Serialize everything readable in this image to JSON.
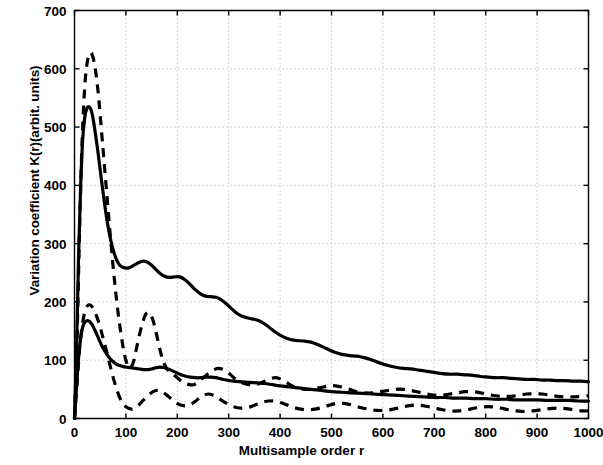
{
  "chart_data": {
    "type": "line",
    "title": "",
    "xlabel": "Multisample order r",
    "ylabel": "Variation coefficient K(r)(arbit. units)",
    "xlim": [
      0,
      1000
    ],
    "ylim": [
      0,
      700
    ],
    "xticks": [
      0,
      100,
      200,
      300,
      400,
      500,
      600,
      700,
      800,
      900,
      1000
    ],
    "yticks": [
      0,
      100,
      200,
      300,
      400,
      500,
      600,
      700
    ],
    "grid": true,
    "legend": "none",
    "series": [
      {
        "name": "upper-solid",
        "style": "solid",
        "color": "#000000",
        "x": [
          0,
          4,
          8,
          12,
          16,
          20,
          24,
          28,
          32,
          36,
          40,
          46,
          52,
          58,
          64,
          70,
          76,
          82,
          88,
          95,
          102,
          110,
          118,
          126,
          134,
          142,
          150,
          158,
          166,
          175,
          185,
          195,
          205,
          215,
          225,
          235,
          245,
          255,
          265,
          275,
          285,
          295,
          305,
          315,
          325,
          335,
          345,
          355,
          365,
          375,
          385,
          400,
          415,
          430,
          445,
          460,
          475,
          490,
          505,
          520,
          535,
          550,
          565,
          580,
          595,
          610,
          625,
          640,
          655,
          670,
          685,
          700,
          715,
          730,
          745,
          760,
          775,
          790,
          805,
          820,
          835,
          850,
          865,
          880,
          895,
          910,
          925,
          940,
          955,
          970,
          985,
          1000
        ],
        "y": [
          0,
          120,
          280,
          400,
          480,
          517,
          532,
          535,
          530,
          515,
          493,
          455,
          412,
          372,
          336,
          308,
          287,
          272,
          263,
          259,
          258,
          260,
          264,
          268,
          270,
          268,
          263,
          256,
          249,
          244,
          242,
          243,
          243,
          238,
          230,
          221,
          214,
          210,
          209,
          208,
          204,
          197,
          189,
          181,
          176,
          173,
          171,
          169,
          165,
          159,
          152,
          143,
          137,
          134,
          133,
          131,
          126,
          120,
          114,
          110,
          108,
          107,
          104,
          100,
          95,
          91,
          88,
          86,
          85,
          83,
          81,
          79,
          77,
          76,
          76,
          75,
          74,
          72,
          71,
          70,
          70,
          69,
          68,
          67,
          67,
          66,
          66,
          65,
          65,
          64,
          64,
          63
        ]
      },
      {
        "name": "upper-dashed",
        "style": "dashed",
        "color": "#000000",
        "x": [
          0,
          5,
          10,
          15,
          20,
          25,
          30,
          34,
          38,
          42,
          46,
          50,
          55,
          60,
          65,
          70,
          75,
          80,
          85,
          90,
          95,
          100,
          105,
          110,
          115,
          120,
          126,
          132,
          138,
          144,
          150,
          156,
          162,
          168,
          174,
          180,
          186,
          192,
          200,
          208,
          216,
          224,
          232,
          240,
          248,
          256,
          264,
          272,
          280,
          290,
          300,
          310,
          320,
          330,
          340,
          350,
          360,
          370,
          380,
          390,
          400,
          412,
          424,
          436,
          448,
          460,
          472,
          484,
          496,
          508,
          520,
          535,
          550,
          565,
          580,
          595,
          610,
          625,
          640,
          655,
          670,
          685,
          700,
          715,
          730,
          745,
          760,
          775,
          790,
          805,
          820,
          835,
          850,
          865,
          880,
          895,
          910,
          925,
          940,
          955,
          970,
          985,
          1000
        ],
        "y": [
          0,
          140,
          330,
          480,
          570,
          612,
          627,
          625,
          612,
          590,
          560,
          520,
          468,
          415,
          362,
          310,
          262,
          218,
          180,
          148,
          120,
          100,
          88,
          88,
          98,
          118,
          142,
          163,
          178,
          182,
          175,
          158,
          135,
          112,
          95,
          85,
          80,
          76,
          70,
          64,
          60,
          58,
          58,
          62,
          68,
          74,
          80,
          84,
          86,
          84,
          78,
          70,
          64,
          60,
          58,
          58,
          60,
          64,
          68,
          70,
          68,
          62,
          56,
          52,
          50,
          50,
          52,
          54,
          56,
          56,
          54,
          50,
          46,
          44,
          44,
          46,
          48,
          50,
          50,
          48,
          45,
          42,
          40,
          40,
          42,
          44,
          46,
          46,
          44,
          41,
          39,
          38,
          38,
          40,
          42,
          43,
          42,
          40,
          38,
          37,
          37,
          38,
          39
        ]
      },
      {
        "name": "lower-solid",
        "style": "solid",
        "color": "#000000",
        "x": [
          0,
          4,
          8,
          12,
          16,
          20,
          25,
          30,
          35,
          40,
          46,
          52,
          58,
          64,
          70,
          76,
          82,
          88,
          95,
          102,
          110,
          118,
          126,
          134,
          142,
          150,
          158,
          166,
          175,
          185,
          195,
          205,
          215,
          225,
          235,
          245,
          255,
          265,
          275,
          285,
          295,
          310,
          325,
          340,
          355,
          370,
          385,
          400,
          420,
          440,
          460,
          480,
          500,
          520,
          540,
          560,
          580,
          600,
          620,
          640,
          660,
          680,
          700,
          720,
          740,
          760,
          780,
          800,
          820,
          840,
          860,
          880,
          900,
          920,
          940,
          960,
          980,
          1000
        ],
        "y": [
          0,
          55,
          105,
          138,
          157,
          165,
          168,
          166,
          160,
          151,
          139,
          127,
          117,
          109,
          102,
          97,
          93,
          91,
          89,
          88,
          87,
          86,
          85,
          84,
          84,
          85,
          87,
          88,
          87,
          84,
          80,
          76,
          73,
          71,
          70,
          70,
          71,
          71,
          70,
          68,
          66,
          64,
          63,
          62,
          61,
          60,
          58,
          56,
          54,
          52,
          50,
          48,
          46,
          45,
          44,
          43,
          42,
          41,
          40,
          39,
          38,
          37,
          36,
          36,
          35,
          35,
          34,
          34,
          33,
          33,
          32,
          32,
          32,
          31,
          31,
          31,
          30,
          30
        ]
      },
      {
        "name": "lower-dashed",
        "style": "dashed",
        "color": "#000000",
        "x": [
          0,
          5,
          10,
          16,
          22,
          28,
          34,
          40,
          46,
          52,
          58,
          64,
          70,
          76,
          82,
          88,
          94,
          100,
          106,
          112,
          118,
          124,
          130,
          137,
          144,
          151,
          158,
          165,
          172,
          180,
          188,
          196,
          204,
          212,
          220,
          228,
          236,
          244,
          252,
          260,
          270,
          280,
          290,
          300,
          310,
          320,
          330,
          342,
          354,
          366,
          378,
          390,
          402,
          414,
          426,
          440,
          454,
          468,
          482,
          496,
          510,
          524,
          540,
          556,
          572,
          588,
          604,
          620,
          636,
          652,
          668,
          684,
          700,
          716,
          732,
          748,
          764,
          780,
          796,
          812,
          828,
          844,
          860,
          876,
          892,
          908,
          924,
          940,
          956,
          972,
          988,
          1000
        ],
        "y": [
          0,
          60,
          120,
          165,
          188,
          195,
          192,
          182,
          168,
          150,
          130,
          110,
          88,
          68,
          50,
          36,
          26,
          20,
          17,
          16,
          18,
          22,
          28,
          34,
          40,
          45,
          48,
          48,
          45,
          40,
          34,
          28,
          24,
          22,
          22,
          25,
          30,
          36,
          40,
          42,
          40,
          35,
          29,
          24,
          20,
          18,
          18,
          20,
          24,
          28,
          30,
          30,
          27,
          23,
          19,
          16,
          15,
          16,
          19,
          23,
          26,
          26,
          23,
          19,
          16,
          14,
          14,
          16,
          19,
          22,
          23,
          21,
          18,
          15,
          13,
          13,
          15,
          18,
          20,
          20,
          18,
          15,
          13,
          12,
          13,
          15,
          17,
          18,
          17,
          15,
          13,
          13
        ]
      }
    ]
  },
  "axes": {
    "x_tick_labels": [
      "0",
      "100",
      "200",
      "300",
      "400",
      "500",
      "600",
      "700",
      "800",
      "900",
      "1000"
    ],
    "y_tick_labels": [
      "0",
      "100",
      "200",
      "300",
      "400",
      "500",
      "600",
      "700"
    ],
    "x_axis_title": "Multisample order r",
    "y_axis_title": "Variation coefficient K(r)(arbit. units)"
  }
}
